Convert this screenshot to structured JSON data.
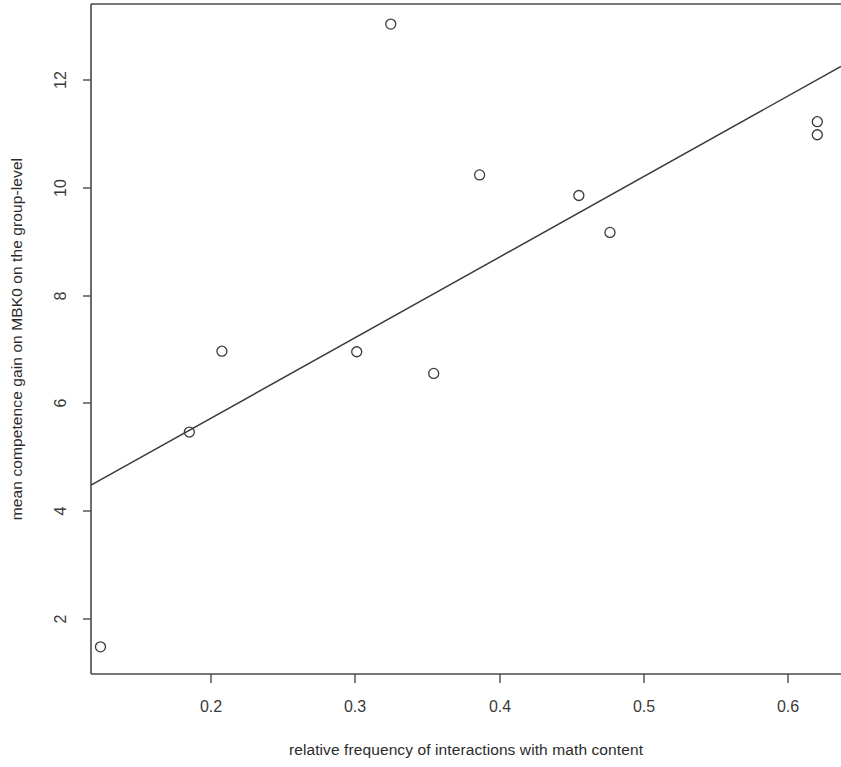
{
  "chart_data": {
    "type": "scatter",
    "title": "",
    "xlabel": "relative frequency of interactions with math content",
    "ylabel": "mean competence gain on MBK0 on the group-level",
    "xlim": [
      0.1306,
      0.637
    ],
    "ylim": [
      1.02,
      13.37
    ],
    "grid": false,
    "legend": "none",
    "xticks": [
      0.2,
      0.3,
      0.4,
      0.5,
      0.6
    ],
    "xtick_labels": [
      "0.2",
      "0.3",
      "0.4",
      "0.5",
      "0.6"
    ],
    "yticks": [
      2,
      4,
      6,
      8,
      10,
      12
    ],
    "ytick_labels": [
      "2",
      "4",
      "6",
      "8",
      "10",
      "12"
    ],
    "marker": "open-circle",
    "points": [
      {
        "x": 0.137,
        "y": 1.52
      },
      {
        "x": 0.197,
        "y": 5.48
      },
      {
        "x": 0.219,
        "y": 6.97
      },
      {
        "x": 0.31,
        "y": 6.96
      },
      {
        "x": 0.333,
        "y": 13.0
      },
      {
        "x": 0.362,
        "y": 6.56
      },
      {
        "x": 0.393,
        "y": 10.22
      },
      {
        "x": 0.46,
        "y": 9.84
      },
      {
        "x": 0.481,
        "y": 9.16
      },
      {
        "x": 0.621,
        "y": 11.2
      },
      {
        "x": 0.621,
        "y": 10.96
      }
    ],
    "series": [
      {
        "name": "groups",
        "x": [
          0.137,
          0.197,
          0.219,
          0.31,
          0.333,
          0.362,
          0.393,
          0.46,
          0.481,
          0.621,
          0.621
        ],
        "values": [
          1.52,
          5.48,
          6.97,
          6.96,
          13.0,
          6.56,
          10.22,
          9.84,
          9.16,
          11.2,
          10.96
        ]
      }
    ],
    "trendline": {
      "type": "linear-fit",
      "x_start": 0.1306,
      "y_start": 4.5,
      "x_end": 0.637,
      "y_end": 12.22
    },
    "colors": {
      "point": "#3b3b3b",
      "line": "#3b3b3b",
      "axis": "#4a4a4a",
      "text": "#2b2b2b",
      "background": "#ffffff"
    }
  }
}
